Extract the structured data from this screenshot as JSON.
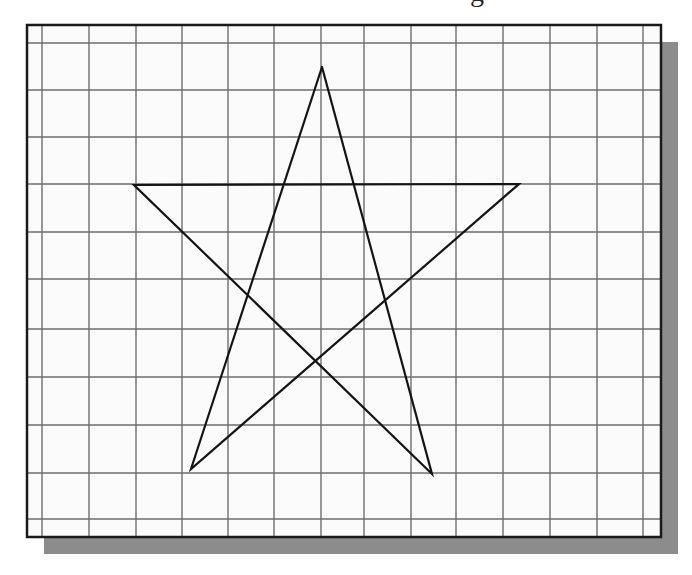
{
  "figure": {
    "cropped_title_fragment": "g",
    "frame": {
      "left": 27,
      "top": 25,
      "right": 661,
      "bottom": 537,
      "border_color": "#1a1a1a",
      "border_width": 2.5,
      "background": "#fbfbfb"
    },
    "shadow": {
      "offset_x": 17,
      "offset_y": 17,
      "color": "#8c8c8c"
    },
    "grid": {
      "line_color": "#6e6e6e",
      "line_width": 1.4,
      "vertical_lines_x": [
        42,
        89,
        136,
        182,
        228,
        274,
        321,
        364,
        411,
        456,
        503,
        550,
        597,
        643
      ],
      "horizontal_lines_y": [
        43,
        90,
        137,
        184,
        232,
        279,
        329,
        377,
        425,
        473,
        519
      ]
    },
    "star": {
      "stroke_color": "#141414",
      "stroke_width": 2.2,
      "vertices": {
        "top": [
          322,
          67
        ],
        "left": [
          134,
          185
        ],
        "right": [
          519,
          184
        ],
        "bottom_left": [
          191,
          469
        ],
        "bottom_right": [
          432,
          474
        ]
      },
      "stroke_order": [
        "top",
        "bottom_right",
        "left",
        "right",
        "bottom_left",
        "top"
      ]
    }
  }
}
